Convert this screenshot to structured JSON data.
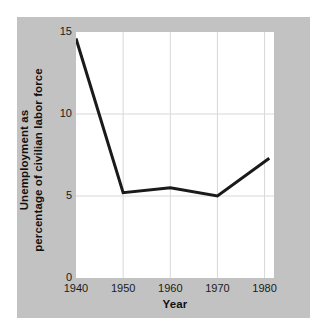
{
  "chart_data": {
    "type": "line",
    "title": "",
    "xlabel": "Year",
    "ylabel_line1": "Unemployment as",
    "ylabel_line2": "percentage of civilian labor force",
    "x": [
      1940,
      1950,
      1960,
      1970,
      1981
    ],
    "values": [
      14.6,
      5.2,
      5.5,
      5.0,
      7.3
    ],
    "series": [
      {
        "name": "Unemployment rate",
        "values": [
          14.6,
          5.2,
          5.5,
          5.0,
          7.3
        ]
      }
    ],
    "xtick_labels": [
      "1940",
      "1950",
      "1960",
      "1970",
      "1980"
    ],
    "xtick_values": [
      1940,
      1950,
      1960,
      1970,
      1980
    ],
    "ytick_labels": [
      "0",
      "5",
      "10",
      "15"
    ],
    "ytick_values": [
      0,
      5,
      10,
      15
    ],
    "xlim": [
      1940,
      1982
    ],
    "ylim": [
      0,
      15
    ],
    "grid": true,
    "legend": "none",
    "line_color": "#1a1a1a",
    "line_width": 3,
    "plot_background": "#ffffff",
    "panel_background": "#c2c2c2",
    "grid_color": "#d8d8d8"
  }
}
